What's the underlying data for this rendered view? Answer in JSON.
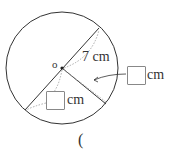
{
  "diagram": {
    "center_label": "o",
    "radius_label": "7 cm",
    "answer_boxes": [
      {
        "unit": "cm",
        "target": "radius (lower-right segment)"
      },
      {
        "unit": "cm",
        "target": "diameter (lower-left part)"
      }
    ],
    "answer_paren": "("
  },
  "colors": {
    "stroke": "#333333",
    "dotted": "#aaaaaa",
    "box_border": "#888888"
  }
}
